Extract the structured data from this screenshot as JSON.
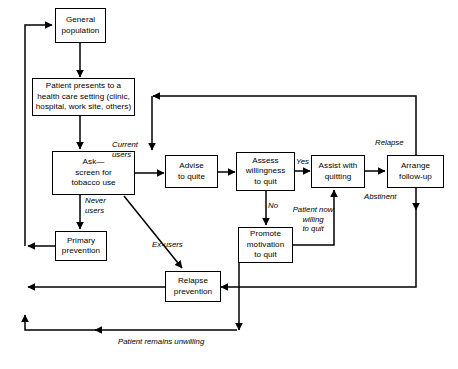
{
  "diagram": {
    "type": "flowchart",
    "stroke_color": "#000000",
    "background_color": "#ffffff",
    "nodes": [
      {
        "id": "general_population",
        "label": "General\npopulation"
      },
      {
        "id": "patient_presents",
        "label": "Patient presents to a\nhealth care setting (clinic,\nhospital, work site, others)"
      },
      {
        "id": "ask_screen",
        "label": "Ask—\nscreen for\ntobacco use"
      },
      {
        "id": "primary_prevention",
        "label": "Primary\nprevention"
      },
      {
        "id": "advise_to_quit",
        "label": "Advise\nto quite"
      },
      {
        "id": "assess_willingness",
        "label": "Assess\nwillingness\nto quit"
      },
      {
        "id": "assist_quitting",
        "label": "Assist with\nquitting"
      },
      {
        "id": "arrange_followup",
        "label": "Arrange\nfollow-up"
      },
      {
        "id": "promote_motivation",
        "label": "Promote\nmotivation\nto quit"
      },
      {
        "id": "relapse_prevention",
        "label": "Relapse\nprevention"
      }
    ],
    "edge_labels": [
      {
        "id": "current_users",
        "text": "Current\nusers"
      },
      {
        "id": "never_users",
        "text": "Never\nusers"
      },
      {
        "id": "ex_users",
        "text": "Ex-users"
      },
      {
        "id": "yes",
        "text": "Yes"
      },
      {
        "id": "no",
        "text": "No"
      },
      {
        "id": "patient_now_willing",
        "text": "Patient now\nwilling\nto quit"
      },
      {
        "id": "relapse",
        "text": "Relapse"
      },
      {
        "id": "abstinent",
        "text": "Abstinent"
      },
      {
        "id": "patient_unwilling",
        "text": "Patient remains unwilling"
      }
    ]
  }
}
